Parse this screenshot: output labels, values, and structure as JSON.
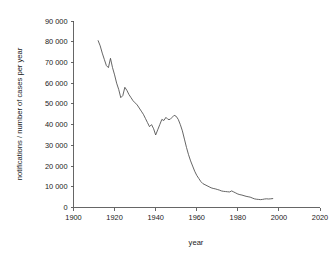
{
  "chart_data": {
    "type": "line",
    "title": "",
    "xlabel": "year",
    "ylabel": "notifications / number of cases per year",
    "xlim": [
      1900,
      2020
    ],
    "ylim": [
      0,
      90000
    ],
    "grid": false,
    "legend": "none",
    "xticks": [
      "1900",
      "1920",
      "1940",
      "1960",
      "1980",
      "2000",
      "2020"
    ],
    "xtick_values": [
      1900,
      1920,
      1940,
      1960,
      1980,
      2000,
      2020
    ],
    "yticks": [
      "0",
      "10 000",
      "20 000",
      "30 000",
      "40 000",
      "50 000",
      "60 000",
      "70 000",
      "80 000",
      "90 000"
    ],
    "ytick_values": [
      0,
      10000,
      20000,
      30000,
      40000,
      50000,
      60000,
      70000,
      80000,
      90000
    ],
    "series": [
      {
        "name": "notifications",
        "x": [
          1912,
          1913,
          1914,
          1915,
          1916,
          1917,
          1918,
          1919,
          1920,
          1921,
          1922,
          1923,
          1924,
          1925,
          1926,
          1927,
          1928,
          1929,
          1930,
          1931,
          1932,
          1933,
          1934,
          1935,
          1936,
          1937,
          1938,
          1939,
          1940,
          1941,
          1942,
          1943,
          1944,
          1945,
          1946,
          1947,
          1948,
          1949,
          1950,
          1951,
          1952,
          1953,
          1954,
          1955,
          1956,
          1957,
          1958,
          1959,
          1960,
          1961,
          1962,
          1963,
          1964,
          1965,
          1966,
          1967,
          1968,
          1969,
          1970,
          1971,
          1972,
          1973,
          1974,
          1975,
          1976,
          1977,
          1978,
          1979,
          1980,
          1981,
          1982,
          1983,
          1984,
          1985,
          1986,
          1987,
          1988,
          1989,
          1990,
          1991,
          1992,
          1993,
          1994,
          1995,
          1996,
          1997
        ],
        "values": [
          80500,
          78000,
          74500,
          71500,
          68500,
          67500,
          72000,
          67500,
          64000,
          60000,
          57000,
          53000,
          54000,
          58000,
          56500,
          54500,
          53000,
          51500,
          50500,
          49500,
          48000,
          46500,
          45000,
          43000,
          41000,
          39000,
          40000,
          38000,
          35000,
          37500,
          40000,
          42500,
          42000,
          43500,
          42500,
          42500,
          43500,
          44500,
          44000,
          42500,
          40000,
          37000,
          33000,
          29000,
          25500,
          22500,
          20000,
          17500,
          15500,
          14000,
          12500,
          11500,
          11000,
          10500,
          10000,
          9500,
          9200,
          9000,
          8700,
          8400,
          8000,
          7800,
          7700,
          7600,
          7500,
          8000,
          7500,
          7000,
          6500,
          6200,
          6000,
          5700,
          5400,
          5200,
          5000,
          4600,
          4200,
          4000,
          3900,
          3800,
          3900,
          4100,
          4200,
          4100,
          4200,
          4300
        ]
      }
    ]
  }
}
